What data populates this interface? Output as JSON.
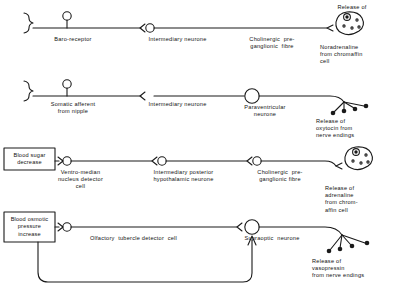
{
  "figure": {
    "type": "neural-reflex-pathway-diagram",
    "stroke_color": "#1a1a1a",
    "background_color": "#ffffff"
  },
  "pathways": [
    {
      "id": "baroreceptor-noradrenaline",
      "receptor_label": "Baro-receptor",
      "relay_label": "Intermediary neurone",
      "effector_label": "Cholinergic  pre-\nganglionic  fibre",
      "terminal_type": "chromaffin-cell",
      "terminal_top_label": "Release of",
      "terminal_bottom_label": "Noradrenaline\nfrom chromaffin\ncell"
    },
    {
      "id": "somatic-afferent-oxytocin",
      "receptor_label": "Somatic afferent\nfrom nipple",
      "relay_label": "Intermediary neurone",
      "effector_label": "Paraventricular\nneurone",
      "terminal_type": "nerve-endings",
      "terminal_bottom_label": "Release of\noxytocin from\nnerve endings"
    },
    {
      "id": "blood-sugar-adrenaline",
      "stimulus_box": "Blood sugar\ndecrease",
      "receptor_label": "Ventro-median\nnucleus detector\ncell",
      "relay_label": "Intermediary posterior\nhypothalamic neurone",
      "effector_label": "Cholinergic  pre-\nganglionic fibre",
      "terminal_type": "chromaffin-cell",
      "terminal_bottom_label": "Release of\nadrenaline\nfrom chrom-\naffin cell"
    },
    {
      "id": "blood-osmotic-vasopressin",
      "stimulus_box": "Blood osmotic\npressure\nincrease",
      "receptor_label": "Olfactory  tubercle detector  cell",
      "effector_label": "Supraoptic  neurone",
      "terminal_type": "nerve-endings",
      "terminal_bottom_label": "Release of\nvasopressin\nfrom nerve endings",
      "feedback_loop": true
    }
  ]
}
